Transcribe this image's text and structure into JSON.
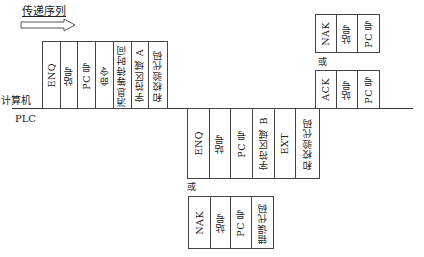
{
  "title": "传递序列",
  "arrow_icon": "right-arrow-icon",
  "labels": {
    "computer": "计算机",
    "plc": "PLC",
    "or_top": "或",
    "or_bottom": "或"
  },
  "computer_frame": {
    "cells": [
      "ENQ",
      "站号",
      "PC 号",
      "命令",
      "消息等待时间",
      "字符区域 A",
      "和校验代码"
    ]
  },
  "plc_frame": {
    "cells": [
      "ENQ",
      "站号",
      "PC 号",
      "字符区域 B",
      "EXT",
      "和校验代码"
    ]
  },
  "plc_nak_frame": {
    "cells": [
      "NAK",
      "站号",
      "PC 号",
      "错误代码"
    ]
  },
  "computer_ack_frame": {
    "cells": [
      "ACK",
      "站号",
      "PC 号"
    ]
  },
  "computer_nak_frame": {
    "cells": [
      "NAK",
      "站号",
      "PC 号"
    ]
  }
}
